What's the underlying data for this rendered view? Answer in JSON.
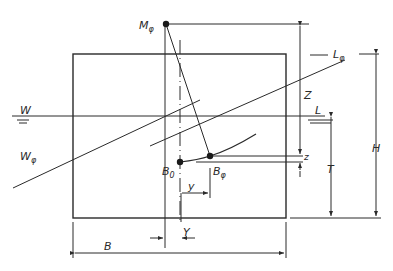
{
  "diagram": {
    "type": "ship-stability-heel-diagram",
    "colors": {
      "line": "#2a2a2a",
      "background": "#ffffff"
    },
    "labels": {
      "metacenter": {
        "main": "M",
        "sub": "φ"
      },
      "waterline_left": "W",
      "waterline_right": "L",
      "inclined_waterline_right": {
        "main": "L",
        "sub": "φ"
      },
      "inclined_waterline_left": {
        "main": "W",
        "sub": "φ"
      },
      "buoyancy_upright": {
        "main": "B",
        "sub": "0"
      },
      "buoyancy_heeled": {
        "main": "B",
        "sub": "φ"
      },
      "dim_Z": "Z",
      "dim_z": "z",
      "dim_T": "T",
      "dim_H": "H",
      "dim_B": "B",
      "dim_Y": "Y",
      "dim_y": "y"
    },
    "dimensions": [
      {
        "name": "Z",
        "meaning": "height of M_phi above B_phi level"
      },
      {
        "name": "z",
        "meaning": "vertical shift of buoyancy centre"
      },
      {
        "name": "T",
        "meaning": "draught"
      },
      {
        "name": "H",
        "meaning": "depth"
      },
      {
        "name": "B",
        "meaning": "breadth"
      },
      {
        "name": "Y",
        "meaning": "offset of centerline"
      },
      {
        "name": "y",
        "meaning": "horizontal shift of buoyancy centre"
      }
    ]
  }
}
